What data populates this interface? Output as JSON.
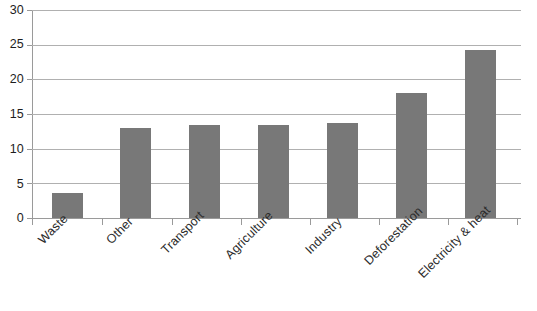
{
  "chart_data": {
    "type": "bar",
    "title": "",
    "subtitle": "",
    "xlabel": "",
    "ylabel": "",
    "categories": [
      "Waste",
      "Other",
      "Transport",
      "Agriculture",
      "Industry",
      "Deforestation",
      "Electricity & heat"
    ],
    "values": [
      3.6,
      13.0,
      13.4,
      13.4,
      13.7,
      18.0,
      24.3
    ],
    "ylim": [
      0,
      30
    ],
    "ytick_labels": [
      "0",
      "5",
      "10",
      "15",
      "20",
      "25",
      "30"
    ],
    "ytick_values": [
      0,
      5,
      10,
      15,
      20,
      25,
      30
    ],
    "grid": true,
    "grid_axis": "y",
    "legend": false,
    "legend_position": "none",
    "bar_color": "#787878",
    "gridline_color": "#b0b0b0",
    "axis_color": "#9a9a9a",
    "text_color": "#2b2b2b",
    "background_color": "#ffffff",
    "xtick_label_rotation": -45,
    "series": [
      {
        "name": "Emissions share",
        "values": [
          3.6,
          13.0,
          13.4,
          13.4,
          13.7,
          18.0,
          24.3
        ]
      }
    ]
  }
}
